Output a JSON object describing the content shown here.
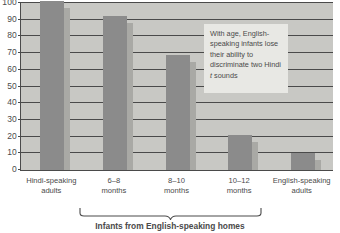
{
  "chart_data": {
    "type": "bar",
    "title": "",
    "xlabel": "Infants from English-speaking homes",
    "ylabel": "",
    "ylim": [
      0,
      100
    ],
    "grid": true,
    "legend": "none",
    "categories": [
      "Hindi-speaking adults",
      "6–8 months",
      "8–10 months",
      "10–12 months",
      "English-speaking adults"
    ],
    "values": [
      101,
      92,
      69,
      21,
      10
    ],
    "y_ticks": [
      0,
      10,
      20,
      30,
      40,
      50,
      60,
      70,
      80,
      90,
      100
    ],
    "annotations": [
      "With age, English-speaking infants lose their ability to discriminate two Hindi t sounds"
    ]
  },
  "axis": {
    "y_ticks": [
      "100",
      "90",
      "80",
      "70",
      "60",
      "50",
      "40",
      "30",
      "20",
      "10",
      "0"
    ],
    "x_categories": [
      {
        "line1": "Hindi-speaking",
        "line2": "adults"
      },
      {
        "line1": "6–8",
        "line2": "months"
      },
      {
        "line1": "8–10",
        "line2": "months"
      },
      {
        "line1": "10–12",
        "line2": "months"
      },
      {
        "line1": "English-speaking",
        "line2": "adults"
      }
    ]
  },
  "callout": {
    "line1": "With age, English-",
    "line2": "speaking infants lose",
    "line3": "their ability to",
    "line4": "discriminate two Hindi",
    "line5_italic": "t",
    "line5_rest": " sounds"
  },
  "caption": {
    "text": "Infants from English-speaking homes"
  },
  "colors": {
    "plot_background": "#c8c8c4",
    "bar_fill": "#8b8b8b",
    "bar_shadow": "#a9a9a5",
    "gridline": "#4a4a4a",
    "callout_background": "#e8e8e4",
    "text": "#4a4a4a"
  }
}
